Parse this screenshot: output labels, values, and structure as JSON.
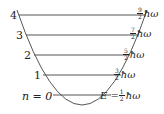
{
  "diagram": {
    "levels": [
      {
        "n": "4",
        "num": "9",
        "den": "2",
        "unit": "ħω",
        "y": 15
      },
      {
        "n": "3",
        "num": "7",
        "den": "2",
        "unit": "ħω",
        "y": 35
      },
      {
        "n": "2",
        "num": "5",
        "den": "2",
        "unit": "ħω",
        "y": 55
      },
      {
        "n": "1",
        "num": "3",
        "den": "2",
        "unit": "ħω",
        "y": 75
      },
      {
        "n": "n = 0",
        "num": "1",
        "den": "2",
        "unit": "ħω",
        "prefix": "E = ",
        "y": 95
      }
    ],
    "colors": {
      "line": "#555555",
      "text": "#222222"
    }
  }
}
